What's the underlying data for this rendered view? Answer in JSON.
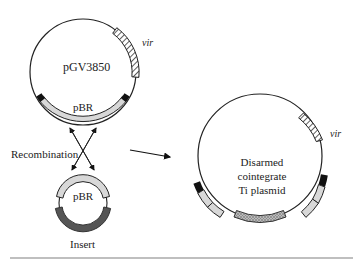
{
  "diagram": {
    "left_plasmid": {
      "name": "pGV3850",
      "vir_label": "vir",
      "pbr_label": "pBR"
    },
    "recombination_label": "Recombination",
    "small_plasmid": {
      "pbr_label": "pBR",
      "insert_label": "Insert"
    },
    "result_plasmid": {
      "line1": "Disarmed",
      "line2": "cointegrate",
      "line3": "Ti plasmid",
      "vir_label": "vir"
    },
    "colors": {
      "outline": "#222222",
      "pbr_fill": "#d8d8d8",
      "insert_fill": "#555555",
      "marker_fill": "#111111",
      "rule": "#aaaaaa"
    }
  }
}
